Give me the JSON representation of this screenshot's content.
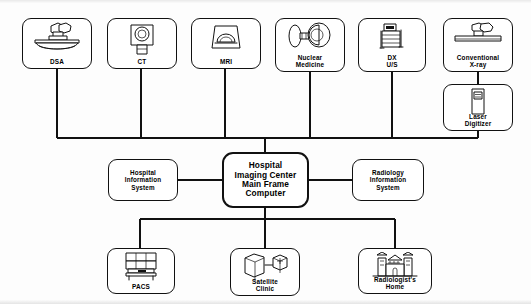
{
  "diagram": {
    "line_color": "#111111",
    "background": "#ffffff",
    "modalities": [
      {
        "id": "dsa",
        "label": "DSA",
        "icon": "dsa-angiography-table-icon"
      },
      {
        "id": "ct",
        "label": "CT",
        "icon": "ct-gantry-icon"
      },
      {
        "id": "mri",
        "label": "MRI",
        "icon": "mri-magnet-icon"
      },
      {
        "id": "nm",
        "label": "Nuclear\nMedicine",
        "icon": "gamma-camera-icon"
      },
      {
        "id": "dxus",
        "label": "DX\nU/S",
        "icon": "ultrasound-cart-icon"
      },
      {
        "id": "cxr",
        "label": "Conventional\nX-ray",
        "icon": "x-ray-table-icon"
      }
    ],
    "peripheral": {
      "id": "laser-digitizer",
      "label": "Laser\nDigitizer",
      "icon": "laser-digitizer-icon"
    },
    "hub": {
      "id": "main-frame",
      "label": "Hospital\nImaging Center\nMain Frame\nComputer"
    },
    "information_systems": [
      {
        "id": "his",
        "label": "Hospital\nInformation\nSystem"
      },
      {
        "id": "ris",
        "label": "Radiology\nInformation\nSystem"
      }
    ],
    "destinations": [
      {
        "id": "pacs",
        "label": "PACS",
        "icon": "pacs-display-workstation-icon"
      },
      {
        "id": "satellite",
        "label": "Satellite\nClinic",
        "icon": "satellite-clinic-network-icon"
      },
      {
        "id": "home",
        "label": "Radiologist's\nHome",
        "icon": "house-icon"
      }
    ]
  }
}
